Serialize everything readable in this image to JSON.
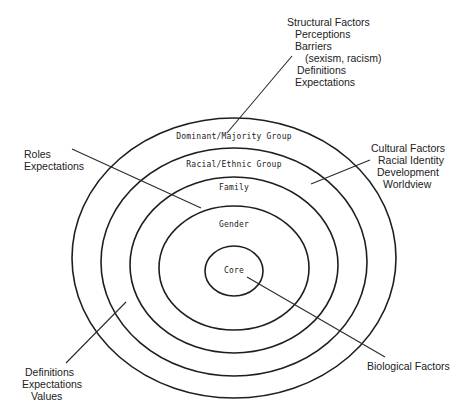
{
  "diagram": {
    "type": "concentric-ellipses",
    "rings": [
      {
        "id": "dominant",
        "label": "Dominant/Majority Group"
      },
      {
        "id": "racial",
        "label": "Racial/Ethnic Group"
      },
      {
        "id": "family",
        "label": "Family"
      },
      {
        "id": "gender",
        "label": "Gender"
      },
      {
        "id": "core",
        "label": "Core"
      }
    ],
    "annotations": {
      "structural": {
        "title": "Structural Factors",
        "lines": [
          "Perceptions",
          "Barriers",
          "(sexism, racism)",
          "Definitions",
          "Expectations"
        ]
      },
      "roles": {
        "lines": [
          "Roles",
          "Expectations"
        ]
      },
      "cultural": {
        "title": "Cultural Factors",
        "lines": [
          "Racial Identity",
          "Development",
          "Worldview"
        ]
      },
      "definitions": {
        "lines": [
          "Definitions",
          "Expectations",
          "Values"
        ]
      },
      "biological": {
        "lines": [
          "Biological Factors"
        ]
      }
    },
    "line_color": "#1e1e1e",
    "background": "#ffffff"
  }
}
